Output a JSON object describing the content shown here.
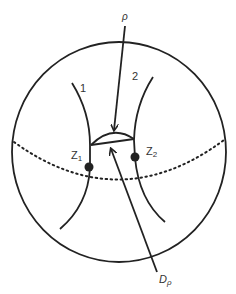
{
  "diagram": {
    "type": "sphere-schematic",
    "labels": {
      "rho": "ρ",
      "curve1": "1",
      "curve2": "2",
      "z1_main": "Z",
      "z1_sub": "1",
      "z2_main": "Z",
      "z2_sub": "2",
      "dp_main": "D",
      "dp_sub": "ρ"
    },
    "colors": {
      "stroke": "#222222",
      "background": "#ffffff"
    },
    "elements": [
      "sphere-outline",
      "dotted-equator",
      "curve-1",
      "curve-2",
      "lens-region",
      "point-z1",
      "point-z2",
      "rho-arrow",
      "dp-arrow"
    ]
  }
}
